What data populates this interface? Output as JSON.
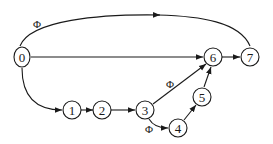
{
  "diagram": {
    "type": "directed-graph",
    "nodes": [
      {
        "id": "0",
        "label": "0",
        "x": 22,
        "y": 57
      },
      {
        "id": "1",
        "label": "1",
        "x": 72,
        "y": 110
      },
      {
        "id": "2",
        "label": "2",
        "x": 102,
        "y": 110
      },
      {
        "id": "3",
        "label": "3",
        "x": 145,
        "y": 110
      },
      {
        "id": "4",
        "label": "4",
        "x": 178,
        "y": 128
      },
      {
        "id": "5",
        "label": "5",
        "x": 202,
        "y": 97
      },
      {
        "id": "6",
        "label": "6",
        "x": 213,
        "y": 57
      },
      {
        "id": "7",
        "label": "7",
        "x": 250,
        "y": 57
      }
    ],
    "edges": [
      {
        "from": "0",
        "to": "7",
        "label": "Φ",
        "shape": "curved-top"
      },
      {
        "from": "0",
        "to": "6",
        "label": ""
      },
      {
        "from": "0",
        "to": "1",
        "label": "",
        "shape": "curved"
      },
      {
        "from": "1",
        "to": "2",
        "label": ""
      },
      {
        "from": "2",
        "to": "3",
        "label": ""
      },
      {
        "from": "3",
        "to": "6",
        "label": "Φ"
      },
      {
        "from": "3",
        "to": "4",
        "label": "Φ"
      },
      {
        "from": "4",
        "to": "5",
        "label": ""
      },
      {
        "from": "5",
        "to": "6",
        "label": ""
      },
      {
        "from": "6",
        "to": "7",
        "label": ""
      }
    ],
    "edge_labels": {
      "e07": "Φ",
      "e36": "Φ",
      "e34": "Φ"
    },
    "node_labels": {
      "n0": "0",
      "n1": "1",
      "n2": "2",
      "n3": "3",
      "n4": "4",
      "n5": "5",
      "n6": "6",
      "n7": "7"
    }
  }
}
